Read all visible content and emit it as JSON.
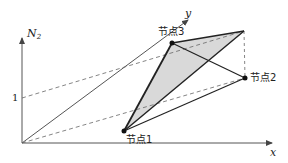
{
  "diagram": {
    "axes": {
      "vertical": {
        "label": "N",
        "subscript": "2"
      },
      "x": {
        "label": "x"
      },
      "y": {
        "label": "y"
      },
      "tick_label": "1"
    },
    "nodes": [
      {
        "id": "node1",
        "label": "节点1"
      },
      {
        "id": "node2",
        "label": "节点2"
      },
      {
        "id": "node3",
        "label": "节点3"
      }
    ],
    "colors": {
      "axis": "#555555",
      "edge": "#222222",
      "dashed": "#666666",
      "fill": "#d9d9d9",
      "node": "#111111"
    }
  }
}
